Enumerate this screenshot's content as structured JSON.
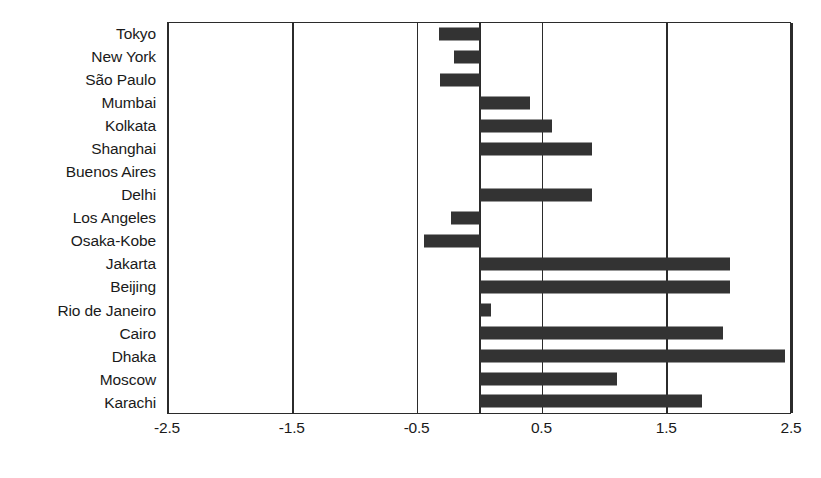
{
  "chart_data": {
    "type": "bar",
    "orientation": "horizontal",
    "title": "",
    "xlabel": "",
    "ylabel": "",
    "xlim": [
      -2.5,
      2.5
    ],
    "xticks": [
      "-2.5",
      "-1.5",
      "-0.5",
      "0.5",
      "1.5",
      "2.5"
    ],
    "xtick_values": [
      -2.5,
      -1.5,
      -0.5,
      0.5,
      1.5,
      2.5
    ],
    "grid": true,
    "grid_axis": "x",
    "legend": false,
    "bar_color": "#333333",
    "axis_color": "#2b2b2b",
    "categories": [
      "Tokyo",
      "New York",
      "São Paulo",
      "Mumbai",
      "Kolkata",
      "Shanghai",
      "Buenos Aires",
      "Delhi",
      "Los Angeles",
      "Osaka-Kobe",
      "Jakarta",
      "Beijing",
      "Rio de Janeiro",
      "Cairo",
      "Dhaka",
      "Moscow",
      "Karachi"
    ],
    "values": [
      -0.33,
      -0.21,
      -0.32,
      0.4,
      0.58,
      0.9,
      0.0,
      0.9,
      -0.23,
      -0.45,
      2.0,
      2.0,
      0.09,
      1.95,
      2.44,
      1.1,
      1.78
    ]
  }
}
